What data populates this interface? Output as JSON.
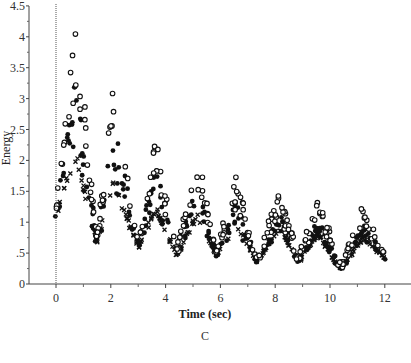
{
  "chart_data": {
    "type": "scatter",
    "title": "",
    "caption": "C",
    "xlabel": "Time (sec)",
    "ylabel": "Energy",
    "xlim": [
      -0.9,
      12.9
    ],
    "ylim": [
      0,
      4.5
    ],
    "x_ticks": [
      0,
      2,
      4,
      6,
      8,
      10,
      12
    ],
    "x_tick_labels": [
      "0",
      "2",
      "4",
      "6",
      "8",
      "10",
      "12"
    ],
    "y_ticks": [
      0,
      0.5,
      1,
      1.5,
      2,
      2.5,
      3,
      3.5,
      4,
      4.5
    ],
    "y_tick_labels": [
      "0",
      ".5",
      "1",
      "1.5",
      "2",
      "2.5",
      "3",
      "3.5",
      "4",
      "4.5"
    ],
    "grid": false,
    "legend": null,
    "vertical_reference_line_x": 0,
    "envelope": {
      "t": [
        0,
        0.73,
        1.5,
        2.1,
        3.0,
        3.65,
        4.4,
        5.15,
        5.85,
        6.55,
        7.35,
        8.15,
        8.85,
        9.55,
        10.4,
        11.2,
        12.0
      ],
      "kind": [
        "start",
        "peak",
        "trough",
        "peak",
        "trough",
        "peak",
        "trough",
        "peak",
        "trough",
        "peak",
        "trough",
        "peak",
        "trough",
        "peak",
        "trough",
        "peak",
        "end"
      ]
    },
    "series": [
      {
        "name": "open-circle",
        "marker": "o",
        "values": [
          1.3,
          4.3,
          0.75,
          3.33,
          0.68,
          2.45,
          0.55,
          2.13,
          0.55,
          1.74,
          0.42,
          1.56,
          0.42,
          1.42,
          0.3,
          1.27,
          0.5
        ]
      },
      {
        "name": "filled-circle",
        "marker": "filled",
        "values": [
          1.25,
          3.4,
          0.7,
          2.75,
          0.63,
          1.95,
          0.5,
          1.7,
          0.5,
          1.35,
          0.38,
          1.2,
          0.38,
          1.1,
          0.26,
          1.0,
          0.45
        ]
      },
      {
        "name": "x-mark",
        "marker": "x",
        "values": [
          1.2,
          2.2,
          0.68,
          1.7,
          0.61,
          1.25,
          0.47,
          1.15,
          0.48,
          1.0,
          0.36,
          0.95,
          0.37,
          0.85,
          0.23,
          0.8,
          0.42
        ]
      }
    ]
  }
}
